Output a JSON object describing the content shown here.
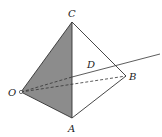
{
  "diagram": {
    "type": "tetrahedron-geometry",
    "points": {
      "O": {
        "label": "O",
        "x": 21,
        "y": 92
      },
      "A": {
        "label": "A",
        "x": 72,
        "y": 118
      },
      "B": {
        "label": "B",
        "x": 126,
        "y": 76
      },
      "C": {
        "label": "C",
        "x": 72,
        "y": 22
      },
      "D": {
        "label": "D",
        "x": 96,
        "y": 72
      }
    },
    "shaded_face": [
      "O",
      "C",
      "A"
    ],
    "colors": {
      "shade": "#8a8a8a",
      "line": "#333333",
      "background": "#ffffff"
    }
  }
}
